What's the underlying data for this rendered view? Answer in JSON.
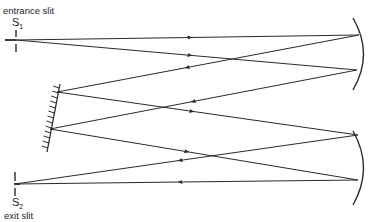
{
  "labels": {
    "entrance": "entrance slit",
    "s1": "S",
    "s1_sub": "1",
    "exit": "exit slit",
    "s2": "S",
    "s2_sub": "2"
  },
  "colors": {
    "line": "#2a2a2a",
    "background": "#ffffff"
  },
  "components": [
    "entrance-slit",
    "collimating-mirror",
    "diffraction-grating",
    "focusing-mirror",
    "exit-slit"
  ]
}
